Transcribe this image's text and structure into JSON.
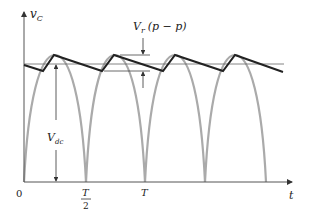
{
  "diagram": {
    "y_axis_label": "v",
    "y_axis_sub": "C",
    "x_axis_label": "t",
    "origin_label": "0",
    "tick_half_num": "T",
    "tick_half_den": "2",
    "tick_full": "T",
    "ripple_label": "V",
    "ripple_sub": "r",
    "ripple_suffix": "(p − p)",
    "vdc_label": "V",
    "vdc_sub": "dc",
    "colors": {
      "rectified": "#aaaaaa",
      "ripple": "#222222",
      "axis": "#444444"
    }
  }
}
